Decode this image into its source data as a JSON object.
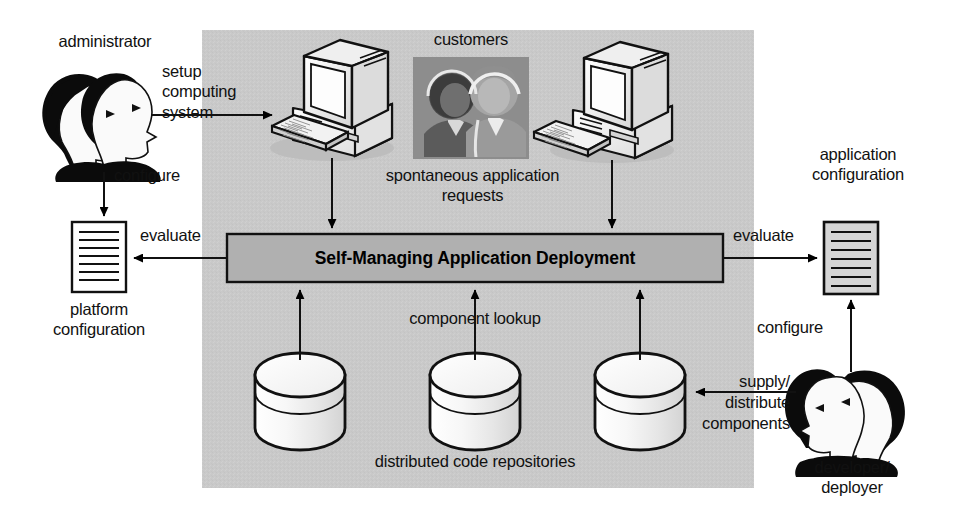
{
  "diagram": {
    "panel": {
      "name": "managed-system-region",
      "fill": "#c9c9c9",
      "x": 202,
      "y": 30,
      "width": 552,
      "height": 458
    },
    "central_box": {
      "label": "Self-Managing Application Deployment",
      "fill": "#b0b0b0",
      "stroke": "#000000"
    },
    "actors": [
      {
        "id": "administrator",
        "label": "administrator"
      },
      {
        "id": "customers",
        "label": "customers"
      },
      {
        "id": "developer-deployer",
        "label": "developer/\ndeployer"
      }
    ],
    "artifacts": [
      {
        "id": "platform-configuration",
        "label": "platform\nconfiguration",
        "fill": "#ffffff"
      },
      {
        "id": "application-configuration",
        "label": "application\nconfiguration",
        "fill": "#d5d5d5"
      }
    ],
    "repositories": {
      "label": "distributed code repositories",
      "count": 3,
      "fill": "#f2f2f2"
    },
    "workstations": [
      {
        "id": "workstation-left"
      },
      {
        "id": "workstation-right"
      }
    ],
    "edges": [
      {
        "id": "setup-computing-system",
        "label": "setup\ncomputing\nsystem",
        "from": "administrator",
        "to": "workstation-left"
      },
      {
        "id": "configure-platform",
        "label": "configure",
        "from": "administrator",
        "to": "platform-configuration"
      },
      {
        "id": "evaluate-platform",
        "label": "evaluate",
        "from": "central-box",
        "to": "platform-configuration"
      },
      {
        "id": "spontaneous-application-requests",
        "label": "spontaneous application\nrequests",
        "from": "workstations",
        "to": "central-box"
      },
      {
        "id": "evaluate-application",
        "label": "evaluate",
        "from": "central-box",
        "to": "application-configuration"
      },
      {
        "id": "configure-application",
        "label": "configure",
        "from": "developer-deployer",
        "to": "application-configuration"
      },
      {
        "id": "component-lookup",
        "label": "component lookup",
        "from": "repositories",
        "to": "central-box"
      },
      {
        "id": "supply-distribute-components",
        "label": "supply/\ndistribute\ncomponents",
        "from": "developer-deployer",
        "to": "repositories"
      }
    ],
    "labels": {
      "administrator": "administrator",
      "setup_line1": "setup",
      "setup_line2": "computing",
      "setup_line3": "system",
      "configure_left": "configure",
      "evaluate_left": "evaluate",
      "platform_line1": "platform",
      "platform_line2": "configuration",
      "customers": "customers",
      "requests_line1": "spontaneous application",
      "requests_line2": "requests",
      "central_box": "Self-Managing Application Deployment",
      "component_lookup": "component lookup",
      "repositories": "distributed code repositories",
      "application_line1": "application",
      "application_line2": "configuration",
      "evaluate_right": "evaluate",
      "configure_right": "configure",
      "supply_line1": "supply/",
      "supply_line2": "distribute",
      "supply_line3": "components",
      "developer_line1": "developer/",
      "developer_line2": "deployer"
    }
  }
}
